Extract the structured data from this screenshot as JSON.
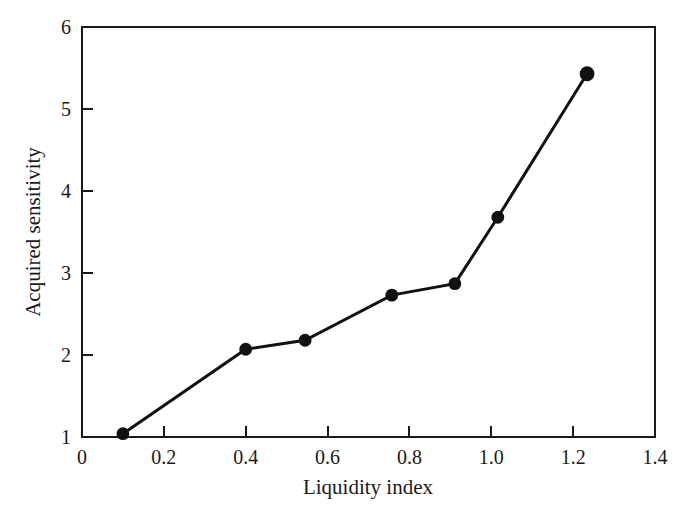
{
  "figure": {
    "background_color": "#ffffff",
    "foreground_color": "#111111",
    "width": 695,
    "height": 514
  },
  "chart_data": {
    "type": "line",
    "title": "",
    "subtitle": "",
    "xlabel": "Liquidity index",
    "ylabel": "Acquired sensitivity",
    "xlim": [
      0,
      1.4
    ],
    "ylim": [
      1,
      6
    ],
    "xticks": [
      0,
      0.2,
      0.4,
      0.6,
      0.8,
      1.0,
      1.2,
      1.4
    ],
    "xtick_labels": [
      "0",
      "0.2",
      "0.4",
      "0.6",
      "0.8",
      "1.0",
      "1.2",
      "1.4"
    ],
    "yticks": [
      1,
      2,
      3,
      4,
      5,
      6
    ],
    "ytick_labels": [
      "1",
      "2",
      "3",
      "4",
      "5",
      "6"
    ],
    "grid": false,
    "legend": null,
    "legend_position": "none",
    "tick_direction": "in",
    "marker": "circle",
    "marker_color": "#111111",
    "line_color": "#111111",
    "series": [
      {
        "name": "Acquired sensitivity",
        "x": [
          0.1,
          0.4,
          0.545,
          0.757,
          0.911,
          1.016,
          1.234
        ],
        "y": [
          1.04,
          2.07,
          2.18,
          2.73,
          2.87,
          3.68,
          5.43
        ]
      }
    ],
    "annotations": []
  }
}
